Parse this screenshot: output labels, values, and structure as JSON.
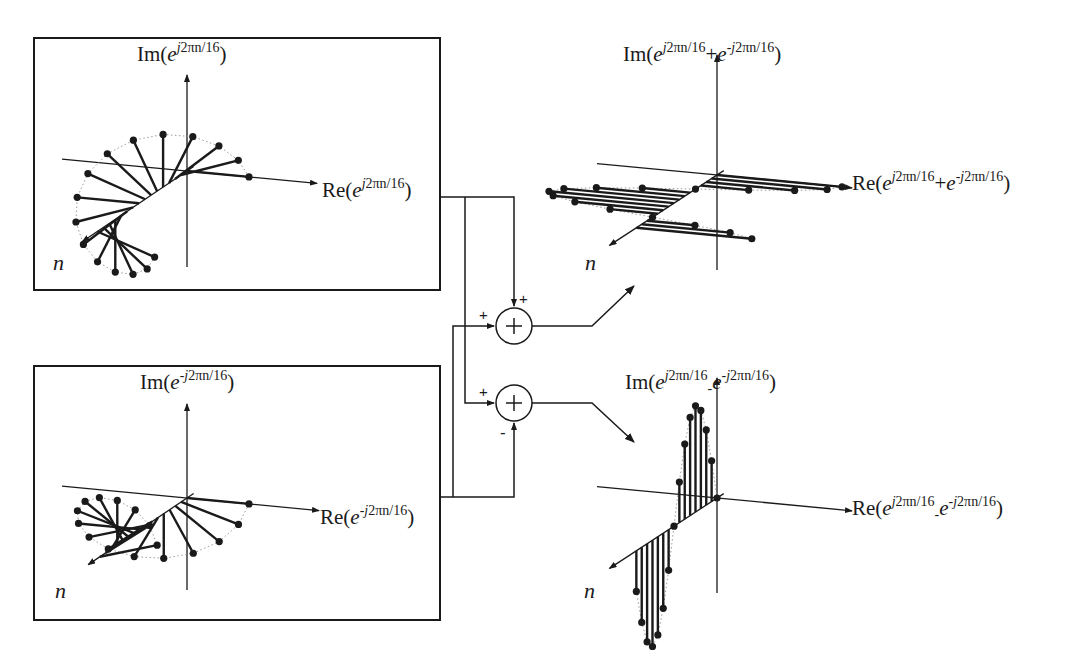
{
  "figure": {
    "colors": {
      "ink": "#1a1a1a",
      "dotted_envelope": "#9a9a9a",
      "background": "#ffffff"
    }
  },
  "panels": {
    "top_left": {
      "im_label": {
        "prefix": "Im(",
        "base": "e",
        "exp_sign": "",
        "exp_j": "j",
        "exp_rest": "2πn/16",
        "suffix": ")"
      },
      "re_label": {
        "prefix": "Re(",
        "base": "e",
        "exp_sign": "",
        "exp_j": "j",
        "exp_rest": "2πn/16",
        "suffix": ")"
      },
      "n_label": "n"
    },
    "bottom_left": {
      "im_label": {
        "prefix": "Im(",
        "base": "e",
        "exp_sign": "-",
        "exp_j": "j",
        "exp_rest": "2πn/16",
        "suffix": ")"
      },
      "re_label": {
        "prefix": "Re(",
        "base": "e",
        "exp_sign": "-",
        "exp_j": "j",
        "exp_rest": "2πn/16",
        "suffix": ")"
      },
      "n_label": "n"
    },
    "top_right": {
      "im_label": {
        "prefix": "Im(",
        "t1_base": "e",
        "t1_j": "j",
        "t1_rest": "2πn/16",
        "op": "+",
        "t2_base": "e",
        "t2_sign": "-",
        "t2_j": "j",
        "t2_rest": "2πn/16",
        "suffix": ")"
      },
      "re_label": {
        "prefix": "Re(",
        "t1_base": "e",
        "t1_j": "j",
        "t1_rest": "2πn/16",
        "op": "+",
        "t2_base": "e",
        "t2_sign": "-",
        "t2_j": "j",
        "t2_rest": "2πn/16",
        "suffix": ")"
      },
      "n_label": "n"
    },
    "bottom_right": {
      "im_label": {
        "prefix": "Im(",
        "t1_base": "e",
        "t1_j": "j",
        "t1_rest": "2πn/16",
        "op": "-",
        "t2_base": "e",
        "t2_sign": "-",
        "t2_j": "j",
        "t2_rest": "2πn/16",
        "suffix": ")"
      },
      "re_label": {
        "prefix": "Re(",
        "t1_base": "e",
        "t1_j": "j",
        "t1_rest": "2πn/16",
        "op": "-",
        "t2_base": "e",
        "t2_sign": "-",
        "t2_j": "j",
        "t2_rest": "2πn/16",
        "suffix": ")"
      },
      "n_label": "n"
    }
  },
  "summers": {
    "adder": {
      "symbol": "+",
      "input_top_sign": "+",
      "input_left_sign": "+"
    },
    "subtractor": {
      "symbol": "+",
      "input_left_sign": "+",
      "input_bottom_sign": "-"
    }
  },
  "signal": {
    "samples_per_period": 16,
    "expression": "e^{±j2πn/16}"
  }
}
